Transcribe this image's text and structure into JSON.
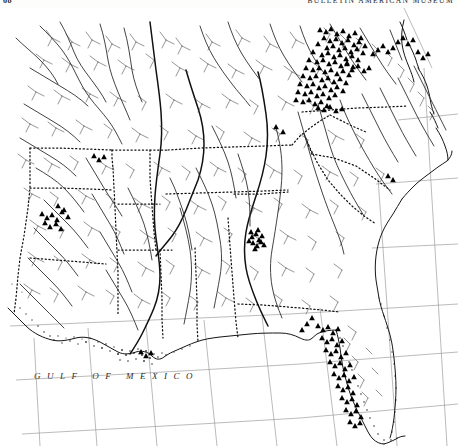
{
  "page": {
    "folio": "68",
    "running_head": "BULLETIN AMERICAN MUSEUM",
    "ocean_label": "GULF OF MEXICO",
    "background_color": "#ffffff",
    "ink_color": "#1a1a1a"
  },
  "map": {
    "title": "GULF OF MEXICO",
    "region": "Southeastern United States",
    "projection_grid": true,
    "symbols": {
      "record": "filled-triangle",
      "record_color": "#000000",
      "river": "thin-line",
      "river_color": "#3a3a3a",
      "boundary": "dotted-line",
      "coastline": "solid-line"
    },
    "graticule": {
      "meridian_count": 7,
      "parallel_count": 5,
      "line_color": "#8a8a8a"
    }
  },
  "chart_data": {
    "type": "scatter",
    "title": "GULF OF MEXICO",
    "xlabel": "",
    "ylabel": "",
    "xlim": [
      0,
      458
    ],
    "ylim": [
      0,
      438
    ],
    "grid": true,
    "legend": [],
    "series": [
      {
        "name": "distribution-records",
        "marker": "triangle",
        "color": "#000000",
        "points": [
          [
            320,
            22
          ],
          [
            326,
            24
          ],
          [
            331,
            21
          ],
          [
            337,
            26
          ],
          [
            343,
            23
          ],
          [
            349,
            28
          ],
          [
            355,
            25
          ],
          [
            361,
            30
          ],
          [
            324,
            30
          ],
          [
            330,
            33
          ],
          [
            336,
            31
          ],
          [
            342,
            35
          ],
          [
            348,
            32
          ],
          [
            354,
            37
          ],
          [
            359,
            34
          ],
          [
            365,
            38
          ],
          [
            318,
            36
          ],
          [
            327,
            40
          ],
          [
            333,
            38
          ],
          [
            339,
            42
          ],
          [
            345,
            40
          ],
          [
            351,
            44
          ],
          [
            357,
            41
          ],
          [
            363,
            45
          ],
          [
            313,
            44
          ],
          [
            322,
            47
          ],
          [
            328,
            45
          ],
          [
            334,
            49
          ],
          [
            340,
            47
          ],
          [
            346,
            51
          ],
          [
            352,
            48
          ],
          [
            358,
            52
          ],
          [
            309,
            52
          ],
          [
            317,
            54
          ],
          [
            323,
            52
          ],
          [
            329,
            56
          ],
          [
            335,
            54
          ],
          [
            341,
            58
          ],
          [
            347,
            55
          ],
          [
            353,
            59
          ],
          [
            306,
            60
          ],
          [
            313,
            62
          ],
          [
            319,
            60
          ],
          [
            325,
            64
          ],
          [
            331,
            62
          ],
          [
            337,
            66
          ],
          [
            343,
            63
          ],
          [
            349,
            67
          ],
          [
            303,
            68
          ],
          [
            310,
            70
          ],
          [
            316,
            68
          ],
          [
            322,
            72
          ],
          [
            328,
            70
          ],
          [
            334,
            74
          ],
          [
            340,
            71
          ],
          [
            346,
            75
          ],
          [
            300,
            76
          ],
          [
            307,
            78
          ],
          [
            313,
            76
          ],
          [
            319,
            80
          ],
          [
            325,
            78
          ],
          [
            331,
            82
          ],
          [
            337,
            79
          ],
          [
            343,
            83
          ],
          [
            298,
            84
          ],
          [
            305,
            86
          ],
          [
            311,
            84
          ],
          [
            317,
            88
          ],
          [
            323,
            86
          ],
          [
            329,
            90
          ],
          [
            335,
            87
          ],
          [
            296,
            92
          ],
          [
            303,
            94
          ],
          [
            309,
            92
          ],
          [
            315,
            96
          ],
          [
            321,
            94
          ],
          [
            327,
            98
          ],
          [
            318,
            100
          ],
          [
            324,
            102
          ],
          [
            330,
            99
          ],
          [
            336,
            103
          ],
          [
            342,
            101
          ],
          [
            347,
            56
          ],
          [
            352,
            62
          ],
          [
            358,
            58
          ],
          [
            364,
            63
          ],
          [
            369,
            60
          ],
          [
            373,
            46
          ],
          [
            378,
            42
          ],
          [
            383,
            38
          ],
          [
            388,
            44
          ],
          [
            393,
            40
          ],
          [
            398,
            34
          ],
          [
            403,
            30
          ],
          [
            408,
            36
          ],
          [
            413,
            32
          ],
          [
            418,
            44
          ],
          [
            423,
            50
          ],
          [
            428,
            46
          ],
          [
            276,
            119
          ],
          [
            283,
            124
          ],
          [
            252,
            229
          ],
          [
            256,
            226
          ],
          [
            259,
            232
          ],
          [
            253,
            235
          ],
          [
            257,
            238
          ],
          [
            261,
            234
          ],
          [
            255,
            241
          ],
          [
            249,
            233
          ],
          [
            262,
            228
          ],
          [
            258,
            222
          ],
          [
            251,
            224
          ],
          [
            264,
            237
          ],
          [
            94,
            148
          ],
          [
            99,
            152
          ],
          [
            104,
            149
          ],
          [
            42,
            206
          ],
          [
            47,
            210
          ],
          [
            52,
            207
          ],
          [
            57,
            212
          ],
          [
            62,
            204
          ],
          [
            68,
            209
          ],
          [
            45,
            215
          ],
          [
            50,
            219
          ],
          [
            56,
            216
          ],
          [
            61,
            221
          ],
          [
            58,
            198
          ],
          [
            64,
            202
          ],
          [
            141,
            344
          ],
          [
            146,
            348
          ],
          [
            151,
            345
          ],
          [
            318,
            318
          ],
          [
            323,
            322
          ],
          [
            328,
            319
          ],
          [
            333,
            325
          ],
          [
            338,
            321
          ],
          [
            322,
            330
          ],
          [
            327,
            334
          ],
          [
            332,
            331
          ],
          [
            337,
            337
          ],
          [
            342,
            333
          ],
          [
            326,
            342
          ],
          [
            331,
            346
          ],
          [
            336,
            343
          ],
          [
            341,
            349
          ],
          [
            346,
            345
          ],
          [
            330,
            354
          ],
          [
            335,
            358
          ],
          [
            340,
            355
          ],
          [
            345,
            361
          ],
          [
            350,
            357
          ],
          [
            334,
            366
          ],
          [
            339,
            370
          ],
          [
            344,
            367
          ],
          [
            349,
            373
          ],
          [
            354,
            369
          ],
          [
            338,
            378
          ],
          [
            343,
            382
          ],
          [
            348,
            379
          ],
          [
            353,
            385
          ],
          [
            342,
            390
          ],
          [
            347,
            394
          ],
          [
            352,
            391
          ],
          [
            357,
            397
          ],
          [
            346,
            402
          ],
          [
            351,
            406
          ],
          [
            356,
            403
          ],
          [
            361,
            409
          ],
          [
            350,
            414
          ],
          [
            355,
            418
          ],
          [
            360,
            415
          ],
          [
            312,
            310
          ],
          [
            307,
            316
          ],
          [
            302,
            322
          ],
          [
            388,
            168
          ],
          [
            393,
            172
          ]
        ]
      }
    ]
  }
}
